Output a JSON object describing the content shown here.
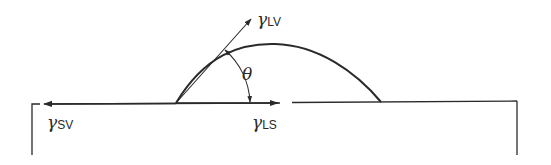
{
  "diagram": {
    "labels": {
      "gamma_lv": {
        "symbol": "γ",
        "subscript": "LV"
      },
      "gamma_sv": {
        "symbol": "γ",
        "subscript": "SV"
      },
      "gamma_ls": {
        "symbol": "γ",
        "subscript": "LS"
      },
      "theta": "θ"
    },
    "colors": {
      "stroke": "#2a2a2a",
      "background": "#ffffff"
    }
  }
}
